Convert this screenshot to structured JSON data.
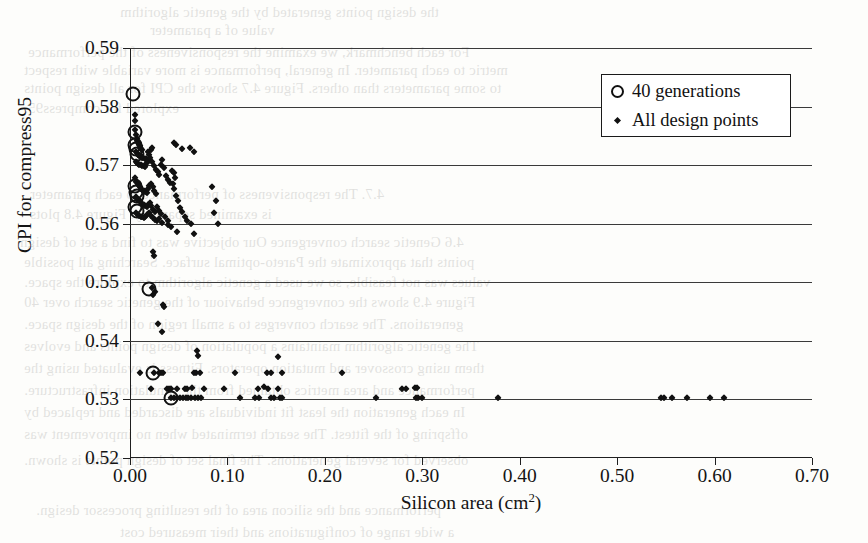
{
  "chart_data": {
    "type": "scatter",
    "title": "",
    "xlabel": "Silicon area (cm2)",
    "xlabel_base": "Silicon area (cm",
    "xlabel_sup": "2",
    "xlabel_tail": ")",
    "ylabel": "CPI for compress95",
    "xlim": [
      0.0,
      0.7
    ],
    "ylim": [
      0.52,
      0.59
    ],
    "xticks": [
      "0.00",
      "0.10",
      "0.20",
      "0.30",
      "0.40",
      "0.50",
      "0.60",
      "0.70"
    ],
    "xtick_values": [
      0.0,
      0.1,
      0.2,
      0.3,
      0.4,
      0.5,
      0.6,
      0.7
    ],
    "yticks": [
      "0.52",
      "0.53",
      "0.54",
      "0.55",
      "0.56",
      "0.57",
      "0.58",
      "0.59"
    ],
    "ytick_values": [
      0.52,
      0.53,
      0.54,
      0.55,
      0.56,
      0.57,
      0.58,
      0.59
    ],
    "grid": "horizontal",
    "legend_position": "top-right",
    "marker_color": "#111111",
    "series": [
      {
        "name": "40 generations",
        "marker": "open-circle",
        "points": [
          [
            0.0035,
            0.5822
          ],
          [
            0.005,
            0.5757
          ],
          [
            0.0055,
            0.5735
          ],
          [
            0.0062,
            0.5728
          ],
          [
            0.007,
            0.5719
          ],
          [
            0.0048,
            0.5665
          ],
          [
            0.006,
            0.5655
          ],
          [
            0.0072,
            0.5648
          ],
          [
            0.0055,
            0.5628
          ],
          [
            0.0068,
            0.5622
          ],
          [
            0.02,
            0.5488
          ],
          [
            0.024,
            0.5345
          ],
          [
            0.042,
            0.5303
          ]
        ]
      },
      {
        "name": "All design points",
        "marker": "filled-diamond",
        "points": [
          [
            0.005,
            0.5785
          ],
          [
            0.0055,
            0.5775
          ],
          [
            0.0048,
            0.576
          ],
          [
            0.006,
            0.5752
          ],
          [
            0.0068,
            0.5745
          ],
          [
            0.0075,
            0.5742
          ],
          [
            0.0082,
            0.5738
          ],
          [
            0.009,
            0.5735
          ],
          [
            0.0098,
            0.5732
          ],
          [
            0.0105,
            0.573
          ],
          [
            0.0112,
            0.5728
          ],
          [
            0.012,
            0.5726
          ],
          [
            0.006,
            0.5722
          ],
          [
            0.0072,
            0.572
          ],
          [
            0.0085,
            0.5718
          ],
          [
            0.0095,
            0.5716
          ],
          [
            0.0108,
            0.5715
          ],
          [
            0.0118,
            0.5714
          ],
          [
            0.0128,
            0.5713
          ],
          [
            0.0138,
            0.5712
          ],
          [
            0.015,
            0.5711
          ],
          [
            0.0162,
            0.571
          ],
          [
            0.0175,
            0.5709
          ],
          [
            0.0188,
            0.5722
          ],
          [
            0.02,
            0.5718
          ],
          [
            0.0215,
            0.5726
          ],
          [
            0.023,
            0.573
          ],
          [
            0.0058,
            0.5706
          ],
          [
            0.007,
            0.5704
          ],
          [
            0.0083,
            0.5702
          ],
          [
            0.0096,
            0.5701
          ],
          [
            0.011,
            0.57
          ],
          [
            0.0125,
            0.5699
          ],
          [
            0.014,
            0.5698
          ],
          [
            0.0155,
            0.5697
          ],
          [
            0.017,
            0.5703
          ],
          [
            0.0185,
            0.5707
          ],
          [
            0.0205,
            0.5712
          ],
          [
            0.0225,
            0.5705
          ],
          [
            0.0245,
            0.5698
          ],
          [
            0.0265,
            0.5692
          ],
          [
            0.0285,
            0.5688
          ],
          [
            0.03,
            0.5684
          ],
          [
            0.0315,
            0.57
          ],
          [
            0.033,
            0.5708
          ],
          [
            0.035,
            0.5695
          ],
          [
            0.037,
            0.5682
          ],
          [
            0.039,
            0.5675
          ],
          [
            0.041,
            0.567
          ],
          [
            0.045,
            0.5738
          ],
          [
            0.047,
            0.5735
          ],
          [
            0.053,
            0.5728
          ],
          [
            0.062,
            0.573
          ],
          [
            0.066,
            0.5722
          ],
          [
            0.0055,
            0.5678
          ],
          [
            0.0065,
            0.5672
          ],
          [
            0.0078,
            0.5668
          ],
          [
            0.009,
            0.5664
          ],
          [
            0.0102,
            0.5662
          ],
          [
            0.0115,
            0.566
          ],
          [
            0.0128,
            0.5658
          ],
          [
            0.0142,
            0.5656
          ],
          [
            0.0156,
            0.5654
          ],
          [
            0.017,
            0.5652
          ],
          [
            0.0185,
            0.566
          ],
          [
            0.02,
            0.5665
          ],
          [
            0.0215,
            0.5668
          ],
          [
            0.0232,
            0.5662
          ],
          [
            0.025,
            0.5656
          ],
          [
            0.0268,
            0.565
          ],
          [
            0.006,
            0.5645
          ],
          [
            0.0072,
            0.5642
          ],
          [
            0.0085,
            0.564
          ],
          [
            0.0098,
            0.5638
          ],
          [
            0.0112,
            0.5636
          ],
          [
            0.0126,
            0.5634
          ],
          [
            0.014,
            0.5632
          ],
          [
            0.0155,
            0.563
          ],
          [
            0.017,
            0.5628
          ],
          [
            0.0186,
            0.5632
          ],
          [
            0.0202,
            0.5636
          ],
          [
            0.022,
            0.563
          ],
          [
            0.024,
            0.5624
          ],
          [
            0.026,
            0.562
          ],
          [
            0.028,
            0.5628
          ],
          [
            0.03,
            0.5622
          ],
          [
            0.032,
            0.5616
          ],
          [
            0.0065,
            0.5618
          ],
          [
            0.008,
            0.5615
          ],
          [
            0.0095,
            0.5613
          ],
          [
            0.011,
            0.5612
          ],
          [
            0.0126,
            0.5611
          ],
          [
            0.0142,
            0.561
          ],
          [
            0.0158,
            0.5612
          ],
          [
            0.0175,
            0.5615
          ],
          [
            0.0195,
            0.5618
          ],
          [
            0.0215,
            0.5614
          ],
          [
            0.0235,
            0.561
          ],
          [
            0.0258,
            0.5606
          ],
          [
            0.028,
            0.5604
          ],
          [
            0.03,
            0.5608
          ],
          [
            0.033,
            0.5602
          ],
          [
            0.036,
            0.5612
          ],
          [
            0.039,
            0.5605
          ],
          [
            0.043,
            0.569
          ],
          [
            0.045,
            0.5686
          ],
          [
            0.046,
            0.5678
          ],
          [
            0.044,
            0.5668
          ],
          [
            0.0455,
            0.566
          ],
          [
            0.047,
            0.5648
          ],
          [
            0.049,
            0.5638
          ],
          [
            0.051,
            0.5626
          ],
          [
            0.053,
            0.562
          ],
          [
            0.056,
            0.5612
          ],
          [
            0.059,
            0.5604
          ],
          [
            0.063,
            0.56
          ],
          [
            0.039,
            0.5598
          ],
          [
            0.042,
            0.5594
          ],
          [
            0.048,
            0.5586
          ],
          [
            0.084,
            0.5662
          ],
          [
            0.088,
            0.5638
          ],
          [
            0.086,
            0.5618
          ],
          [
            0.09,
            0.56
          ],
          [
            0.066,
            0.5582
          ],
          [
            0.024,
            0.5552
          ],
          [
            0.0248,
            0.5545
          ],
          [
            0.023,
            0.549
          ],
          [
            0.0255,
            0.5483
          ],
          [
            0.024,
            0.5478
          ],
          [
            0.034,
            0.5462
          ],
          [
            0.0348,
            0.5458
          ],
          [
            0.029,
            0.5428
          ],
          [
            0.033,
            0.5415
          ],
          [
            0.069,
            0.5382
          ],
          [
            0.07,
            0.5375
          ],
          [
            0.152,
            0.5372
          ],
          [
            0.01,
            0.5345
          ],
          [
            0.0245,
            0.5345
          ],
          [
            0.03,
            0.5345
          ],
          [
            0.032,
            0.5345
          ],
          [
            0.034,
            0.5345
          ],
          [
            0.0655,
            0.5345
          ],
          [
            0.068,
            0.5345
          ],
          [
            0.0715,
            0.5345
          ],
          [
            0.108,
            0.5345
          ],
          [
            0.1405,
            0.5345
          ],
          [
            0.145,
            0.5345
          ],
          [
            0.156,
            0.5345
          ],
          [
            0.218,
            0.5345
          ],
          [
            0.0215,
            0.5318
          ],
          [
            0.038,
            0.5318
          ],
          [
            0.04,
            0.5318
          ],
          [
            0.042,
            0.5318
          ],
          [
            0.048,
            0.5318
          ],
          [
            0.056,
            0.5318
          ],
          [
            0.058,
            0.5318
          ],
          [
            0.064,
            0.532
          ],
          [
            0.076,
            0.5318
          ],
          [
            0.0968,
            0.5318
          ],
          [
            0.131,
            0.5318
          ],
          [
            0.138,
            0.5322
          ],
          [
            0.142,
            0.5318
          ],
          [
            0.152,
            0.5318
          ],
          [
            0.042,
            0.5303
          ],
          [
            0.045,
            0.5303
          ],
          [
            0.048,
            0.5303
          ],
          [
            0.051,
            0.5303
          ],
          [
            0.054,
            0.5303
          ],
          [
            0.057,
            0.5303
          ],
          [
            0.06,
            0.5303
          ],
          [
            0.063,
            0.5303
          ],
          [
            0.067,
            0.5303
          ],
          [
            0.07,
            0.5303
          ],
          [
            0.073,
            0.5303
          ],
          [
            0.113,
            0.5303
          ],
          [
            0.128,
            0.5303
          ],
          [
            0.132,
            0.5303
          ],
          [
            0.145,
            0.5303
          ],
          [
            0.148,
            0.5303
          ],
          [
            0.154,
            0.5303
          ],
          [
            0.156,
            0.5303
          ],
          [
            0.253,
            0.5303
          ],
          [
            0.279,
            0.5318
          ],
          [
            0.283,
            0.5318
          ],
          [
            0.293,
            0.532
          ],
          [
            0.295,
            0.532
          ],
          [
            0.294,
            0.5303
          ],
          [
            0.296,
            0.5303
          ],
          [
            0.3,
            0.5303
          ],
          [
            0.378,
            0.5303
          ],
          [
            0.545,
            0.5303
          ],
          [
            0.548,
            0.5303
          ],
          [
            0.556,
            0.5303
          ],
          [
            0.572,
            0.5303
          ],
          [
            0.595,
            0.5303
          ],
          [
            0.61,
            0.5303
          ]
        ]
      }
    ]
  },
  "legend": {
    "items": [
      {
        "label": "40 generations",
        "marker": "open-circle"
      },
      {
        "label": "All design points",
        "marker": "filled-diamond"
      }
    ]
  },
  "bleed_text": {
    "lines": [
      {
        "text": "the design points generated by the genetic algorithm",
        "x": 120,
        "y": 4
      },
      {
        "text": "value of a parameter",
        "x": 150,
        "y": 22
      },
      {
        "text": "For each benchmark, we examine the responsiveness of the performance",
        "x": 28,
        "y": 44
      },
      {
        "text": "metric to each parameter. In general, performance is more variable with respect",
        "x": 24,
        "y": 62
      },
      {
        "text": "to some parameters than others. Figure 4.7 shows the CPI for all design points",
        "x": 24,
        "y": 80
      },
      {
        "text": "explored for compress95.",
        "x": 24,
        "y": 100
      },
      {
        "text": "4.7. The responsiveness of performance to each parameter",
        "x": 30,
        "y": 186
      },
      {
        "text": "is examined separately. Figure 4.8 plots",
        "x": 30,
        "y": 206
      },
      {
        "text": "4.6  Genetic search convergence  Our objective was to find a set of design",
        "x": 20,
        "y": 234
      },
      {
        "text": "points that approximate the Pareto-optimal surface. Searching all possible",
        "x": 24,
        "y": 254
      },
      {
        "text": "values was not feasible, so we used a genetic algorithm to explore the space.",
        "x": 24,
        "y": 274
      },
      {
        "text": "Figure 4.9 shows the convergence behaviour of the genetic search over 40",
        "x": 24,
        "y": 294
      },
      {
        "text": "generations. The search converges to a small region of the design space.",
        "x": 24,
        "y": 316
      },
      {
        "text": "The genetic algorithm maintains a population of design points and evolves",
        "x": 24,
        "y": 338
      },
      {
        "text": "them using crossover and mutation operators. Fitness is evaluated using the",
        "x": 24,
        "y": 360
      },
      {
        "text": "performance and area metrics obtained from the simulation infrastructure.",
        "x": 24,
        "y": 382
      },
      {
        "text": "In each generation the least fit individuals are discarded and replaced by",
        "x": 24,
        "y": 404
      },
      {
        "text": "offspring of the fittest. The search terminated when no improvement was",
        "x": 24,
        "y": 426
      },
      {
        "text": "observed for several generations. The final set of design points is shown.",
        "x": 24,
        "y": 452
      },
      {
        "text": "performance and the silicon area of the resulting processor design.",
        "x": 36,
        "y": 502
      },
      {
        "text": "a wide range of configurations and their measured cost",
        "x": 120,
        "y": 524
      }
    ]
  }
}
